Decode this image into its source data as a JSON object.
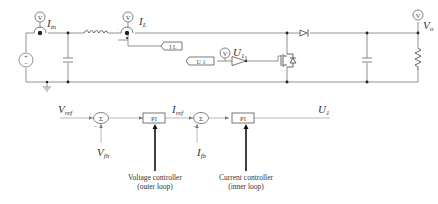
{
  "circuit": {
    "meters": {
      "input_current": {
        "glyph": "V",
        "label": "I",
        "sub": "in"
      },
      "inductor_current": {
        "glyph": "V",
        "label": "I",
        "sub": "L"
      },
      "gate_signal": {
        "glyph": "V",
        "label": "U",
        "sub": "1"
      },
      "output_voltage": {
        "glyph": "V",
        "label": "V",
        "sub": "o"
      }
    },
    "tags": {
      "il_tag": "I L",
      "u1_tag": "U 1"
    }
  },
  "control": {
    "vref": {
      "label": "V",
      "sub": "ref"
    },
    "vfb": {
      "label": "V",
      "sub": "fb"
    },
    "iref": {
      "label": "I",
      "sub": "ref"
    },
    "ifb": {
      "label": "I",
      "sub": "fb"
    },
    "u1": {
      "label": "U",
      "sub": "1"
    },
    "sum_symbol": "Σ",
    "plus": "+",
    "minus": "–",
    "pi1": "PI",
    "pi2": "PI",
    "voltage_caption": [
      "Voltage controller",
      "(outer loop)"
    ],
    "current_caption": [
      "Current controller",
      "(inner loop)"
    ]
  }
}
